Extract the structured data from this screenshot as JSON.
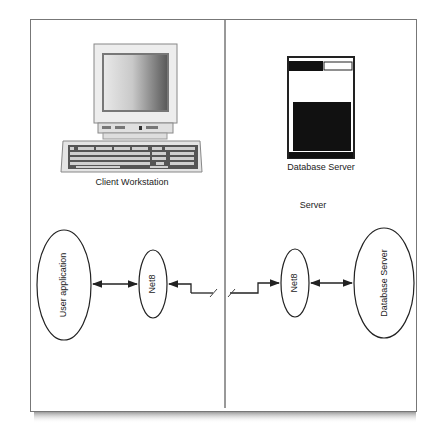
{
  "diagram": {
    "client_side": {
      "icon_label": "Client Workstation",
      "ellipses": [
        {
          "id": "user-app",
          "label": "User application"
        },
        {
          "id": "net8-client",
          "label": "Net8"
        }
      ]
    },
    "server_side": {
      "icon_label": "Database Server",
      "section_label": "Server",
      "ellipses": [
        {
          "id": "net8-server",
          "label": "Net8"
        },
        {
          "id": "db-server",
          "label": "Database Server"
        }
      ]
    },
    "connections": [
      {
        "from": "User application",
        "to": "Net8",
        "type": "bidirectional"
      },
      {
        "from": "Net8",
        "to": "Net8",
        "type": "network-link"
      },
      {
        "from": "Net8",
        "to": "Database Server",
        "type": "bidirectional"
      }
    ],
    "colors": {
      "line": "#222222",
      "frame": "#777777",
      "background": "#ffffff"
    }
  }
}
